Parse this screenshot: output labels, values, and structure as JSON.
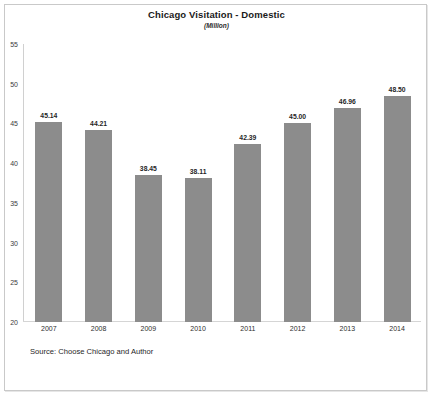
{
  "chart_data": {
    "type": "bar",
    "title": "Chicago Visitation - Domestic",
    "subtitle": "(Million)",
    "xlabel": "",
    "ylabel": "",
    "categories": [
      "2007",
      "2008",
      "2009",
      "2010",
      "2011",
      "2012",
      "2013",
      "2014"
    ],
    "values": [
      45.14,
      44.21,
      38.45,
      38.11,
      42.39,
      45.0,
      46.96,
      48.5
    ],
    "value_labels": [
      "45.14",
      "44.21",
      "38.45",
      "38.11",
      "42.39",
      "45.00",
      "46.96",
      "48.50"
    ],
    "ylim": [
      20,
      55
    ],
    "ytick_step": 5,
    "ytick_labels": [
      "55",
      "50",
      "45",
      "40",
      "35",
      "30",
      "25",
      "20"
    ],
    "ytick_values": [
      55,
      50,
      45,
      40,
      35,
      30,
      25,
      20
    ],
    "grid": false,
    "legend": null,
    "bar_color": "#8c8c8c",
    "series": [
      {
        "name": "Chicago Visitation - Domestic",
        "values": [
          45.14,
          44.21,
          38.45,
          38.11,
          42.39,
          45.0,
          46.96,
          48.5
        ]
      }
    ]
  },
  "source": {
    "text": "Source: Choose Chicago and Author"
  }
}
